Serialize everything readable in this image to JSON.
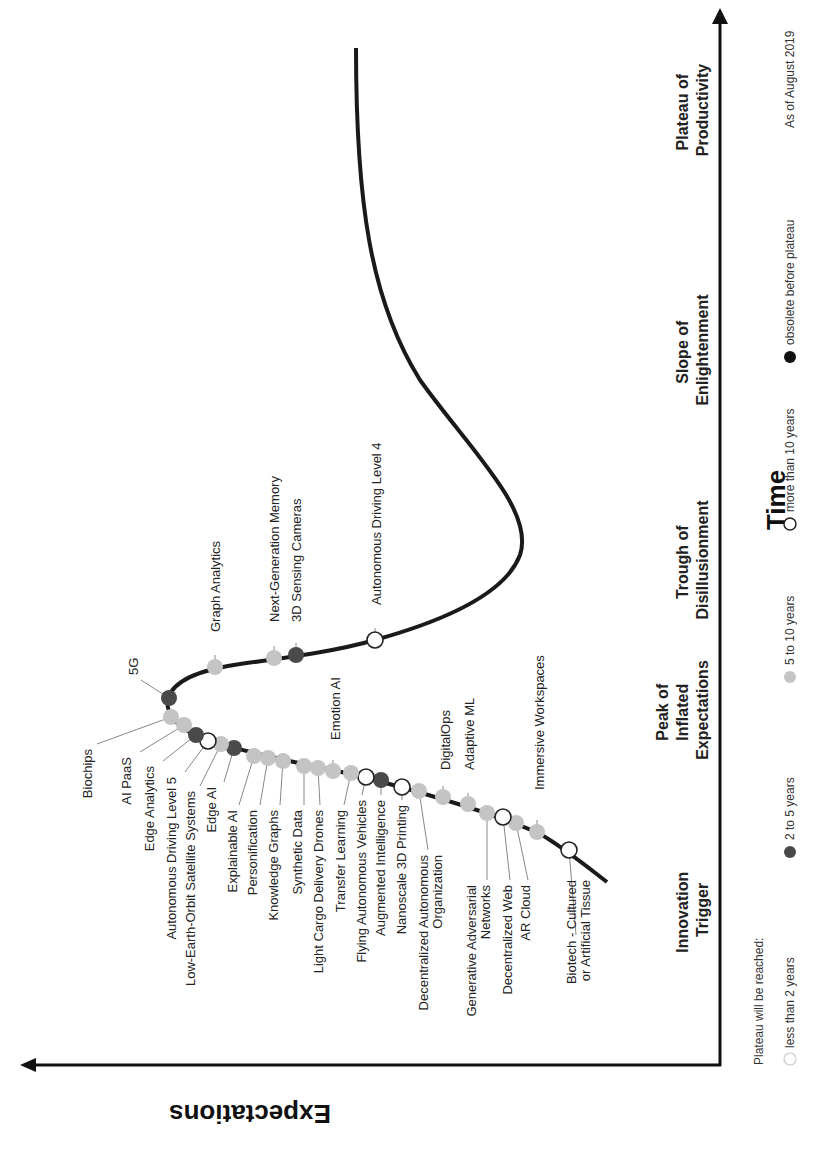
{
  "chart_data": {
    "type": "line",
    "orientation": "rotated-90-clockwise",
    "xlabel": "Time",
    "ylabel": "Expectations",
    "grid": false,
    "as_of": "As of August 2019",
    "phases": [
      {
        "line1": "Innovation",
        "line2": "Trigger"
      },
      {
        "line1": "Peak of",
        "line2": "Inflated",
        "line3": "Expectations"
      },
      {
        "line1": "Trough of",
        "line2": "Disillusionment"
      },
      {
        "line1": "Slope of",
        "line2": "Enlightenment"
      },
      {
        "line1": "Plateau of",
        "line2": "Productivity"
      }
    ],
    "legend": {
      "title": "Plateau will be reached:",
      "items": [
        {
          "label": "less than 2 years",
          "category": "lt2",
          "color": "#ffffff",
          "stroke": "#cccccc"
        },
        {
          "label": "2 to 5 years",
          "category": "2to5",
          "color": "#4a4a4a"
        },
        {
          "label": "5 to 10 years",
          "category": "5to10",
          "color": "#c4c4c4"
        },
        {
          "label": "more than 10 years",
          "category": "gt10",
          "color": "#ffffff",
          "stroke": "#222222"
        },
        {
          "label": "obsolete before plateau",
          "category": "obsolete",
          "color": "#111111"
        }
      ]
    },
    "technologies": [
      {
        "name": "Biotech - Cultured or Artificial Tissue",
        "phase": "Innovation Trigger",
        "plateau": "more than 10 years"
      },
      {
        "name": "Immersive Workspaces",
        "phase": "Innovation Trigger",
        "plateau": "5 to 10 years"
      },
      {
        "name": "AR Cloud",
        "phase": "Innovation Trigger",
        "plateau": "5 to 10 years"
      },
      {
        "name": "Decentralized Web",
        "phase": "Innovation Trigger",
        "plateau": "more than 10 years"
      },
      {
        "name": "Generative Adversarial Networks",
        "phase": "Innovation Trigger",
        "plateau": "5 to 10 years"
      },
      {
        "name": "Adaptive ML",
        "phase": "Innovation Trigger",
        "plateau": "5 to 10 years"
      },
      {
        "name": "DigitalOps",
        "phase": "Innovation Trigger",
        "plateau": "5 to 10 years"
      },
      {
        "name": "Decentralized Autonomous Organization",
        "phase": "Innovation Trigger",
        "plateau": "5 to 10 years"
      },
      {
        "name": "Nanoscale 3D Printing",
        "phase": "Innovation Trigger",
        "plateau": "more than 10 years"
      },
      {
        "name": "Augmented Intelligence",
        "phase": "Innovation Trigger",
        "plateau": "2 to 5 years"
      },
      {
        "name": "Flying Autonomous Vehicles",
        "phase": "Innovation Trigger",
        "plateau": "more than 10 years"
      },
      {
        "name": "Transfer Learning",
        "phase": "Innovation Trigger",
        "plateau": "5 to 10 years"
      },
      {
        "name": "Emotion AI",
        "phase": "Innovation Trigger",
        "plateau": "5 to 10 years"
      },
      {
        "name": "Light Cargo Delivery Drones",
        "phase": "Innovation Trigger",
        "plateau": "5 to 10 years"
      },
      {
        "name": "Synthetic Data",
        "phase": "Innovation Trigger",
        "plateau": "5 to 10 years"
      },
      {
        "name": "Knowledge Graphs",
        "phase": "Peak of Inflated Expectations",
        "plateau": "5 to 10 years"
      },
      {
        "name": "Personification",
        "phase": "Peak of Inflated Expectations",
        "plateau": "5 to 10 years"
      },
      {
        "name": "Explainable AI",
        "phase": "Peak of Inflated Expectations",
        "plateau": "5 to 10 years"
      },
      {
        "name": "Edge AI",
        "phase": "Peak of Inflated Expectations",
        "plateau": "2 to 5 years"
      },
      {
        "name": "Low-Earth-Orbit Satellite Systems",
        "phase": "Peak of Inflated Expectations",
        "plateau": "5 to 10 years"
      },
      {
        "name": "Autonomous Driving Level 5",
        "phase": "Peak of Inflated Expectations",
        "plateau": "more than 10 years"
      },
      {
        "name": "Edge Analytics",
        "phase": "Peak of Inflated Expectations",
        "plateau": "2 to 5 years"
      },
      {
        "name": "AI PaaS",
        "phase": "Peak of Inflated Expectations",
        "plateau": "5 to 10 years"
      },
      {
        "name": "Biochips",
        "phase": "Peak of Inflated Expectations",
        "plateau": "5 to 10 years"
      },
      {
        "name": "5G",
        "phase": "Peak of Inflated Expectations",
        "plateau": "2 to 5 years"
      },
      {
        "name": "Graph Analytics",
        "phase": "Trough of Disillusionment",
        "plateau": "5 to 10 years"
      },
      {
        "name": "Next-Generation Memory",
        "phase": "Trough of Disillusionment",
        "plateau": "5 to 10 years"
      },
      {
        "name": "3D Sensing Cameras",
        "phase": "Trough of Disillusionment",
        "plateau": "2 to 5 years"
      },
      {
        "name": "Autonomous Driving Level 4",
        "phase": "Trough of Disillusionment",
        "plateau": "more than 10 years"
      }
    ]
  },
  "points": [
    {
      "name": "Biotech - Cultured",
      "name2": "or Artificial Tissue",
      "cat": "gt10",
      "cx": 569,
      "cy": 850,
      "lx": 576,
      "ly": 935,
      "tx": 576,
      "ty": 880
    },
    {
      "name": "Immersive Workspaces",
      "cat": "5to10",
      "cx": 537,
      "cy": 832,
      "lx": 537,
      "ly": 820,
      "tx": 544,
      "ty": 790
    },
    {
      "name": "AR Cloud",
      "cat": "5to10",
      "cx": 516,
      "cy": 823,
      "lx": 528,
      "ly": 880,
      "tx": 530,
      "ty": 885
    },
    {
      "name": "Decentralized Web",
      "cat": "gt10",
      "cx": 503,
      "cy": 817,
      "lx": 510,
      "ly": 880,
      "tx": 512,
      "ty": 885
    },
    {
      "name": "Generative Adversarial",
      "name2": "Networks",
      "cat": "5to10",
      "cx": 487,
      "cy": 813,
      "lx": 487,
      "ly": 880,
      "tx": 476,
      "ty": 885
    },
    {
      "name": "Adaptive ML",
      "cat": "5to10",
      "cx": 468,
      "cy": 804,
      "lx": 468,
      "ly": 793,
      "tx": 474,
      "ty": 770
    },
    {
      "name": "DigitalOps",
      "cat": "5to10",
      "cx": 443,
      "cy": 797,
      "lx": 443,
      "ly": 786,
      "tx": 450,
      "ty": 770
    },
    {
      "name": "Decentralized Autonomous",
      "name2": "Organization",
      "cat": "5to10",
      "cx": 419,
      "cy": 791,
      "lx": 428,
      "ly": 850,
      "tx": 428,
      "ty": 855
    },
    {
      "name": "Nanoscale 3D Printing",
      "cat": "gt10",
      "cx": 402,
      "cy": 787,
      "lx": 402,
      "ly": 800,
      "tx": 406,
      "ty": 805
    },
    {
      "name": "Augmented Intelligence",
      "cat": "2to5",
      "cx": 381,
      "cy": 780,
      "lx": 381,
      "ly": 795,
      "tx": 385,
      "ty": 800
    },
    {
      "name": "Flying Autonomous Vehicles",
      "cat": "gt10",
      "cx": 366,
      "cy": 777,
      "lx": 362,
      "ly": 795,
      "tx": 366,
      "ty": 800
    },
    {
      "name": "Transfer Learning",
      "cat": "5to10",
      "cx": 351,
      "cy": 773,
      "lx": 344,
      "ly": 805,
      "tx": 345,
      "ty": 810
    },
    {
      "name": "Emotion AI",
      "cat": "5to10",
      "cx": 333,
      "cy": 771,
      "lx": 333,
      "ly": 760,
      "tx": 340,
      "ty": 740
    },
    {
      "name": "Light Cargo Delivery Drones",
      "cat": "5to10",
      "cx": 318,
      "cy": 768,
      "lx": 320,
      "ly": 805,
      "tx": 323,
      "ty": 810
    },
    {
      "name": "Synthetic Data",
      "cat": "5to10",
      "cx": 304,
      "cy": 766,
      "lx": 304,
      "ly": 805,
      "tx": 302,
      "ty": 810
    },
    {
      "name": "Knowledge Graphs",
      "cat": "5to10",
      "cx": 283,
      "cy": 761,
      "lx": 280,
      "ly": 805,
      "tx": 278,
      "ty": 810
    },
    {
      "name": "Personification",
      "cat": "5to10",
      "cx": 268,
      "cy": 758,
      "lx": 260,
      "ly": 805,
      "tx": 257,
      "ty": 810
    },
    {
      "name": "Explainable AI",
      "cat": "5to10",
      "cx": 254,
      "cy": 756,
      "lx": 239,
      "ly": 805,
      "tx": 237,
      "ty": 810
    },
    {
      "name": "Edge AI",
      "cat": "2to5",
      "cx": 234,
      "cy": 748,
      "lx": 224,
      "ly": 782,
      "tx": 216,
      "ty": 787
    },
    {
      "name": "Low-Earth-Orbit Satellite Systems",
      "cat": "5to10",
      "cx": 221,
      "cy": 744,
      "lx": 200,
      "ly": 786,
      "tx": 195,
      "ty": 791
    },
    {
      "name": "Autonomous Driving Level 5",
      "cat": "gt10",
      "cx": 208,
      "cy": 741,
      "lx": 185,
      "ly": 772,
      "tx": 176,
      "ty": 777
    },
    {
      "name": "Edge Analytics",
      "cat": "2to5",
      "cx": 196,
      "cy": 735,
      "lx": 163,
      "ly": 761,
      "tx": 154,
      "ty": 766
    },
    {
      "name": "AI PaaS",
      "cat": "5to10",
      "cx": 184,
      "cy": 725,
      "lx": 140,
      "ly": 752,
      "tx": 131,
      "ty": 757
    },
    {
      "name": "Biochips",
      "cat": "5to10",
      "cx": 171,
      "cy": 717,
      "lx": 97,
      "ly": 744,
      "tx": 92,
      "ty": 749
    },
    {
      "name": "5G",
      "cat": "2to5",
      "cx": 169,
      "cy": 698,
      "lx": 141,
      "ly": 680,
      "tx": 138,
      "ty": 675
    },
    {
      "name": "Graph Analytics",
      "cat": "5to10",
      "cx": 215,
      "cy": 667,
      "lx": 215,
      "ly": 655,
      "tx": 220,
      "ty": 632
    },
    {
      "name": "Next-Generation Memory",
      "cat": "5to10",
      "cx": 274,
      "cy": 658,
      "lx": 274,
      "ly": 646,
      "tx": 279,
      "ty": 622
    },
    {
      "name": "3D Sensing Cameras",
      "cat": "2to5",
      "cx": 296,
      "cy": 655,
      "lx": 296,
      "ly": 643,
      "tx": 301,
      "ty": 622
    },
    {
      "name": "Autonomous Driving Level 4",
      "cat": "gt10",
      "cx": 375,
      "cy": 640,
      "lx": 375,
      "ly": 628,
      "tx": 381,
      "ty": 605
    }
  ],
  "colors": {
    "gt10_fill": "#ffffff",
    "gt10_stroke": "#222222",
    "2to5": "#4a4a4a",
    "5to10": "#c4c4c4",
    "obsolete": "#111111",
    "lt2_stroke": "#cccccc",
    "curve": "#1a1a1a",
    "leader": "#888888"
  }
}
